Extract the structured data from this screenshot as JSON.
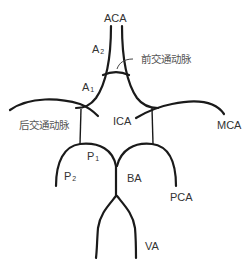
{
  "diagram": {
    "labels": {
      "aca": "ACA",
      "a2_main": "A",
      "a2_sub": "2",
      "a1_main": "A",
      "a1_sub": "1",
      "acom": "前交通动脉",
      "pcom": "后交通动脉",
      "ica": "ICA",
      "mca": "MCA",
      "p1_main": "P",
      "p1_sub": "1",
      "p2_main": "P",
      "p2_sub": "2",
      "ba": "BA",
      "pca": "PCA",
      "va": "VA"
    },
    "colors": {
      "line": "#1a1a1a",
      "text": "#333333",
      "background": "#ffffff"
    }
  }
}
